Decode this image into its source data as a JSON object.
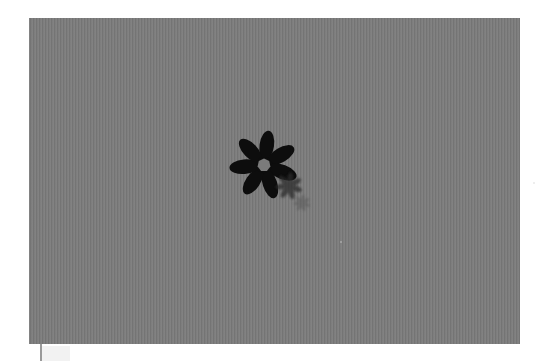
{
  "scene": {
    "description": "Gray textured panel with a black seven-petal flower and fading motion-trail copies",
    "panel": {
      "x": 29,
      "y": 18,
      "width": 491,
      "height": 326,
      "color": "#7b7b7b"
    },
    "flowers": [
      {
        "cx": 264,
        "cy": 165,
        "r": 33,
        "petals": 7,
        "color": "#0d0d0d",
        "opacity": 1.0
      },
      {
        "cx": 289,
        "cy": 186,
        "r": 13,
        "petals": 7,
        "color": "#2a2a2a",
        "opacity": 0.75
      },
      {
        "cx": 302,
        "cy": 203,
        "r": 8,
        "petals": 7,
        "color": "#555555",
        "opacity": 0.5
      }
    ],
    "specks": [
      {
        "x": 340,
        "y": 241,
        "color": "#a8a8a8"
      },
      {
        "x": 533,
        "y": 182,
        "color": "#e8e8e8"
      }
    ]
  }
}
